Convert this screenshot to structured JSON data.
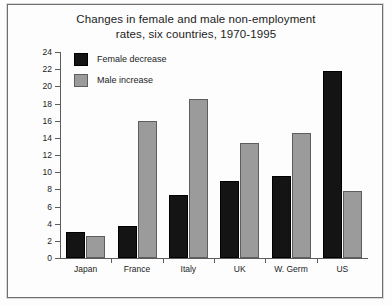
{
  "chart_data": {
    "type": "bar",
    "title": "Changes in female and male non-employment rates, six countries, 1970-1995",
    "title_line1": "Changes in female and male non-employment",
    "title_line2": "rates, six countries, 1970-1995",
    "xlabel": "",
    "ylabel": "",
    "categories": [
      "Japan",
      "France",
      "Italy",
      "UK",
      "W. Germ",
      "US"
    ],
    "series": [
      {
        "name": "Female decrease",
        "color": "#141414",
        "values": [
          3.0,
          3.7,
          7.3,
          9.0,
          9.5,
          21.8
        ]
      },
      {
        "name": "Male increase",
        "color": "#9b9b9b",
        "values": [
          2.6,
          16.0,
          18.5,
          13.4,
          14.6,
          7.8
        ]
      }
    ],
    "ylim": [
      0,
      24
    ],
    "ytick_step": 2,
    "yticks": [
      0,
      2,
      4,
      6,
      8,
      10,
      12,
      14,
      16,
      18,
      20,
      22,
      24
    ],
    "grid": false,
    "legend_position": "top-left-inside"
  }
}
